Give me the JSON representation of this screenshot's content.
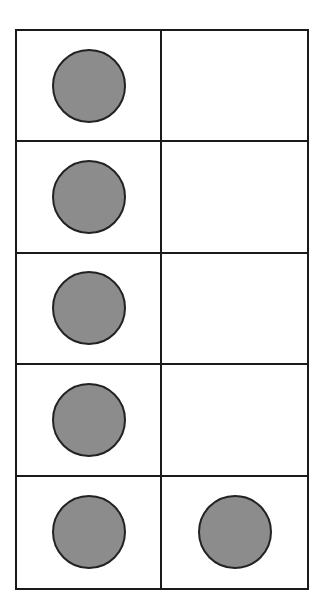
{
  "diagram": {
    "type": "ten-frame",
    "rows": 5,
    "columns": 2,
    "counter_color": "#8c8c8c",
    "outline_color": "#1a1a1a",
    "filled_count": 6,
    "cells": [
      {
        "row": 0,
        "col": 0,
        "filled": true
      },
      {
        "row": 0,
        "col": 1,
        "filled": false
      },
      {
        "row": 1,
        "col": 0,
        "filled": true
      },
      {
        "row": 1,
        "col": 1,
        "filled": false
      },
      {
        "row": 2,
        "col": 0,
        "filled": true
      },
      {
        "row": 2,
        "col": 1,
        "filled": false
      },
      {
        "row": 3,
        "col": 0,
        "filled": true
      },
      {
        "row": 3,
        "col": 1,
        "filled": false
      },
      {
        "row": 4,
        "col": 0,
        "filled": true
      },
      {
        "row": 4,
        "col": 1,
        "filled": true
      }
    ]
  }
}
